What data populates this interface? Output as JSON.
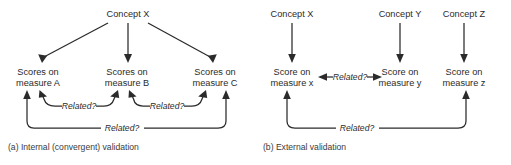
{
  "figure": {
    "width": 511,
    "height": 165,
    "background": "#ffffff",
    "stroke_color": "#2b2b2b",
    "text_color": "#2b2b2b"
  },
  "panel_a": {
    "caption": "(a) Internal (convergent) validation",
    "concept": "Concept X",
    "measures": [
      {
        "line1": "Scores on",
        "line2": "measure A"
      },
      {
        "line1": "Scores on",
        "line2": "measure B"
      },
      {
        "line1": "Scores on",
        "line2": "measure C"
      }
    ],
    "relations": [
      {
        "label": "Related?",
        "from": "measure A",
        "to": "measure B"
      },
      {
        "label": "Related?",
        "from": "measure B",
        "to": "measure C"
      },
      {
        "label": "Related?",
        "from": "measure A",
        "to": "measure C"
      }
    ]
  },
  "panel_b": {
    "caption": "(b) External validation",
    "concepts": [
      "Concept X",
      "Concept Y",
      "Concept Z"
    ],
    "measures": [
      {
        "line1": "Score on",
        "line2": "measure x"
      },
      {
        "line1": "Score on",
        "line2": "measure y"
      },
      {
        "line1": "Score on",
        "line2": "measure z"
      }
    ],
    "relations": [
      {
        "label": "Related?",
        "from": "measure x",
        "to": "measure y"
      },
      {
        "label": "Related?",
        "from": "measure x",
        "to": "measure z"
      }
    ]
  }
}
